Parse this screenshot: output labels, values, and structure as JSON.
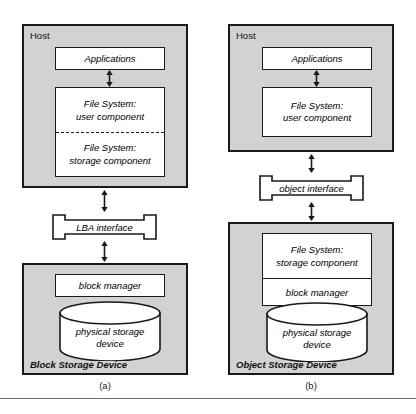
{
  "figure": {
    "caption_a": "(a)",
    "caption_b": "(b)"
  },
  "panel_a": {
    "host": {
      "title": "Host",
      "applications": "Applications",
      "file_system_user_line1": "File System:",
      "file_system_user_line2": "user component",
      "file_system_storage_line1": "File System:",
      "file_system_storage_line2": "storage component"
    },
    "interface": "LBA interface",
    "device": {
      "title": "Block Storage Device",
      "block_manager": "block manager",
      "physical_storage_line1": "physical storage",
      "physical_storage_line2": "device"
    }
  },
  "panel_b": {
    "host": {
      "title": "Host",
      "applications": "Applications",
      "file_system_user_line1": "File System:",
      "file_system_user_line2": "user component"
    },
    "interface": "object interface",
    "device": {
      "title": "Object Storage Device",
      "file_system_storage_line1": "File System:",
      "file_system_storage_line2": "storage component",
      "block_manager": "block manager",
      "physical_storage_line1": "physical storage",
      "physical_storage_line2": "device"
    }
  },
  "colors": {
    "panel_fill": "#d2d2d2",
    "box_fill": "#ffffff",
    "stroke": "#1a1a1a",
    "background": "#ffffff",
    "rule": "#6b6b6b"
  }
}
